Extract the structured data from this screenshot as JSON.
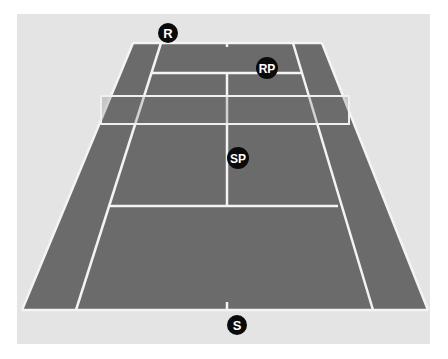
{
  "diagram": {
    "type": "tennis-court-perspective",
    "colors": {
      "background_panel": "#e4e4e4",
      "court_surface": "#6b6b6b",
      "lines": "#f4f4f4",
      "net": "#f0f0f0",
      "marker_fill": "#0a0a0a",
      "marker_text": "#ffffff"
    },
    "markers": [
      {
        "id": "R",
        "label": "R",
        "meaning": "receiver",
        "x": 168,
        "y": 33,
        "r": 10
      },
      {
        "id": "RP",
        "label": "RP",
        "meaning": "receiver partner",
        "x": 267,
        "y": 68,
        "r": 11
      },
      {
        "id": "SP",
        "label": "SP",
        "meaning": "server partner",
        "x": 238,
        "y": 158,
        "r": 11
      },
      {
        "id": "S",
        "label": "S",
        "meaning": "server",
        "x": 237,
        "y": 325,
        "r": 10
      }
    ]
  }
}
